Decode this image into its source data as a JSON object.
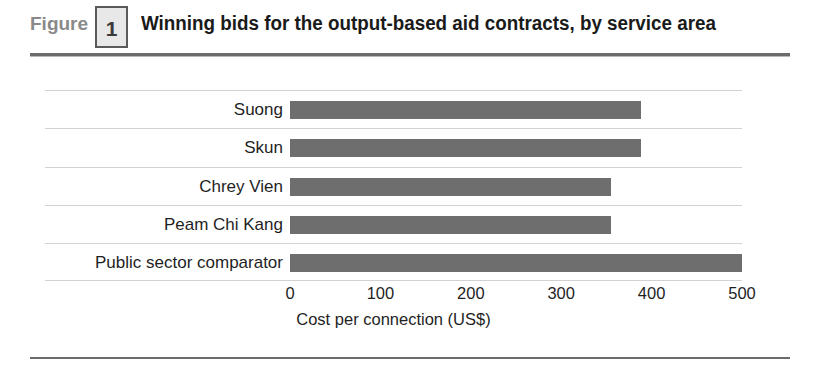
{
  "figure": {
    "label": "Figure",
    "number": "1",
    "title": "Winning bids for the output-based aid contracts, by service area"
  },
  "chart_data": {
    "type": "bar",
    "orientation": "horizontal",
    "title": "Winning bids for the output-based aid contracts, by service area",
    "categories": [
      "Suong",
      "Skun",
      "Chrey Vien",
      "Peam Chi Kang",
      "Public sector comparator"
    ],
    "values": [
      388,
      388,
      355,
      355,
      500
    ],
    "xlabel": "Cost per connection (US$)",
    "ylabel": "",
    "xlim": [
      0,
      500
    ],
    "xticks": [
      0,
      100,
      200,
      300,
      400,
      500
    ],
    "xtick_labels": [
      "0",
      "100",
      "200",
      "300",
      "400",
      "500"
    ],
    "grid": "horizontal",
    "legend": "none",
    "bar_color": "#6e6e6e",
    "gridline_color": "#d2d2d2"
  }
}
